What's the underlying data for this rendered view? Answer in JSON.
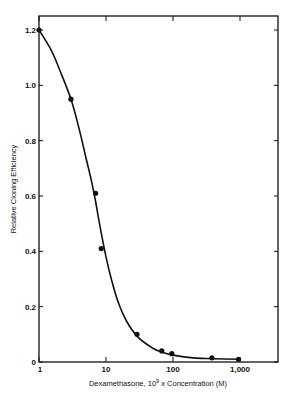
{
  "chart_data": {
    "type": "line",
    "title": "",
    "xlabel": "Dexamethasone, 10⁹ x Concentration (M)",
    "xlabel_parts": {
      "prefix": "Dexamethasone, 10",
      "sup": "9",
      "suffix": " x Concentration (M)"
    },
    "ylabel": "Relative Cloning Efficiency",
    "xscale": "log",
    "xlim": [
      1,
      4000
    ],
    "ylim": [
      0,
      1.26
    ],
    "x_ticks": [
      1,
      10,
      100,
      1000
    ],
    "x_tick_labels": [
      "1",
      "10",
      "100",
      "1,000"
    ],
    "y_ticks": [
      0,
      0.2,
      0.4,
      0.6,
      0.8,
      1.0,
      1.2
    ],
    "y_tick_labels": [
      "0",
      "0.2",
      "0.4",
      "0.6",
      "0.8",
      "1.0",
      "1.2"
    ],
    "grid": false,
    "legend": null,
    "series": [
      {
        "name": "Measured",
        "style": "points",
        "x": [
          1,
          3,
          7,
          8.5,
          29,
          68,
          96,
          380,
          950
        ],
        "y": [
          1.2,
          0.95,
          0.61,
          0.41,
          0.1,
          0.04,
          0.03,
          0.015,
          0.01
        ]
      },
      {
        "name": "Fitted curve",
        "style": "line",
        "x": [
          1,
          1.5,
          2,
          3,
          4,
          5,
          6,
          7,
          8,
          10,
          12,
          15,
          20,
          30,
          50,
          70,
          100,
          200,
          400,
          1000
        ],
        "y": [
          1.2,
          1.13,
          1.06,
          0.95,
          0.84,
          0.74,
          0.66,
          0.58,
          0.5,
          0.38,
          0.3,
          0.22,
          0.15,
          0.09,
          0.05,
          0.035,
          0.025,
          0.015,
          0.012,
          0.01
        ]
      }
    ]
  }
}
